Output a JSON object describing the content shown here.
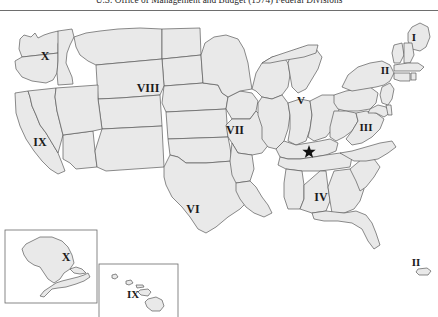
{
  "figure": {
    "title": "U.S. Office of Management and Budget (1974) Federal Divisions",
    "map_kind": "choropleth-region-map",
    "fill_color": "#e9e9e9",
    "border_color": "#5a5a5a",
    "background_color": "#ffffff",
    "label_color": "#1b1b1b"
  },
  "regions": [
    {
      "id": "region-1",
      "label": "I",
      "x": 414,
      "y": 27,
      "font_size": 11
    },
    {
      "id": "region-2",
      "label": "II",
      "x": 385,
      "y": 60,
      "font_size": 11
    },
    {
      "id": "region-3",
      "label": "III",
      "x": 366,
      "y": 117,
      "font_size": 11
    },
    {
      "id": "region-4",
      "label": "IV",
      "x": 321,
      "y": 187,
      "font_size": 12
    },
    {
      "id": "region-5",
      "label": "V",
      "x": 301,
      "y": 90,
      "font_size": 11
    },
    {
      "id": "region-6",
      "label": "VI",
      "x": 193,
      "y": 199,
      "font_size": 12
    },
    {
      "id": "region-7",
      "label": "VII",
      "x": 235,
      "y": 120,
      "font_size": 12
    },
    {
      "id": "region-8",
      "label": "VIII",
      "x": 148,
      "y": 78,
      "font_size": 12
    },
    {
      "id": "region-9",
      "label": "IX",
      "x": 40,
      "y": 132,
      "font_size": 12
    },
    {
      "id": "region-10",
      "label": "X",
      "x": 45,
      "y": 46,
      "font_size": 12
    }
  ],
  "inset_labels": [
    {
      "id": "alaska-label",
      "label": "X",
      "x": 66,
      "y": 247,
      "font_size": 12
    },
    {
      "id": "hawaii-label",
      "label": "IX",
      "x": 133,
      "y": 284,
      "font_size": 11
    },
    {
      "id": "puertorico-label",
      "label": "II",
      "x": 416,
      "y": 252,
      "font_size": 11
    }
  ],
  "markers": [
    {
      "id": "capital-star",
      "shape": "star",
      "x": 309,
      "y": 141,
      "color": "#111111"
    }
  ],
  "insets": [
    {
      "id": "alaska-inset",
      "x": 5,
      "y": 219,
      "width": 92,
      "height": 73
    },
    {
      "id": "hawaii-inset",
      "x": 99,
      "y": 253,
      "width": 79,
      "height": 55
    }
  ]
}
